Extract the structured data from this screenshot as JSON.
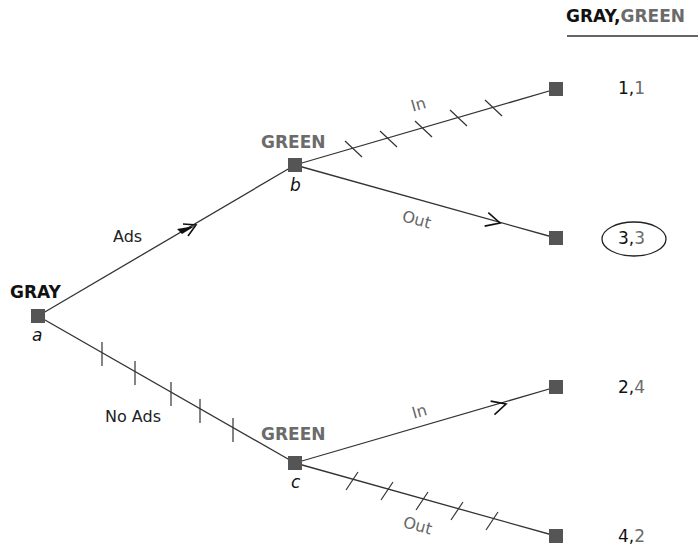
{
  "header": {
    "player1": "GRAY",
    "separator": ",",
    "player2": "GREEN"
  },
  "nodes": {
    "a": {
      "player": "GRAY",
      "id": "a"
    },
    "b": {
      "player": "GREEN",
      "id": "b"
    },
    "c": {
      "player": "GREEN",
      "id": "c"
    }
  },
  "branches": {
    "ads": "Ads",
    "no_ads": "No Ads",
    "b_in": "In",
    "b_out": "Out",
    "c_in": "In",
    "c_out": "Out"
  },
  "payoffs": [
    {
      "gray": "1",
      "sep": ",",
      "green": "1",
      "equilibrium": false
    },
    {
      "gray": "3",
      "sep": ",",
      "green": "3",
      "equilibrium": true
    },
    {
      "gray": "2",
      "sep": ",",
      "green": "4",
      "equilibrium": false
    },
    {
      "gray": "4",
      "sep": ",",
      "green": "2",
      "equilibrium": false
    }
  ],
  "colors": {
    "gray_player": "#111111",
    "green_player": "#6b6b6b",
    "node_fill": "#555555",
    "line": "#333333"
  }
}
